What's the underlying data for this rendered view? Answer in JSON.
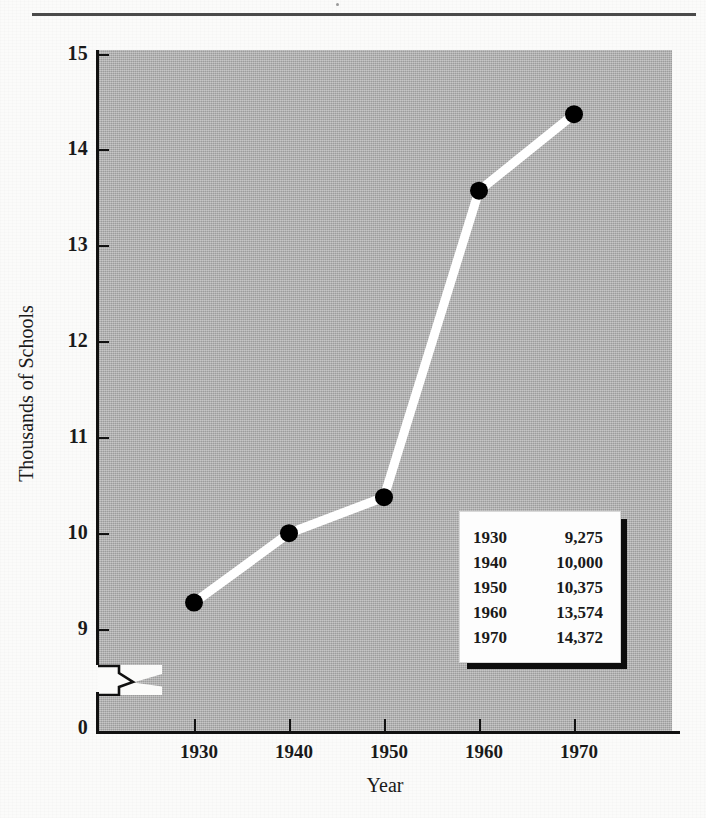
{
  "page": {
    "background_color": "#fbfbfa",
    "rule_color": "#4a4a4a"
  },
  "chart_data": {
    "type": "line",
    "title": "",
    "xlabel": "Year",
    "ylabel": "Thousands of Schools",
    "x": [
      1930,
      1940,
      1950,
      1960,
      1970
    ],
    "categories": [
      "1930",
      "1940",
      "1950",
      "1960",
      "1970"
    ],
    "values": [
      9.275,
      10.0,
      10.375,
      13.574,
      14.372
    ],
    "values_raw": [
      9275,
      10000,
      10375,
      13574,
      14372
    ],
    "series": [
      {
        "name": "Thousands of Schools",
        "values": [
          9.275,
          10.0,
          10.375,
          13.574,
          14.372
        ]
      }
    ],
    "ylim": [
      9,
      15
    ],
    "y_ticks": [
      "15",
      "14",
      "13",
      "12",
      "11",
      "10",
      "9",
      "0"
    ],
    "x_ticks": [
      "1930",
      "1940",
      "1950",
      "1960",
      "1970"
    ],
    "axis_break": true,
    "axis_break_note": "zigzag break between 0 and 9",
    "grid": false,
    "legend": "none",
    "plot_background_color": "#ababab",
    "line_color": "#ffffff",
    "marker_color": "#000000"
  },
  "inset_table": {
    "columns": [
      "Year",
      "Schools"
    ],
    "rows": [
      {
        "year": "1930",
        "value": "9,275"
      },
      {
        "year": "1940",
        "value": "10,000"
      },
      {
        "year": "1950",
        "value": "10,375"
      },
      {
        "year": "1960",
        "value": "13,574"
      },
      {
        "year": "1970",
        "value": "14,372"
      }
    ]
  }
}
